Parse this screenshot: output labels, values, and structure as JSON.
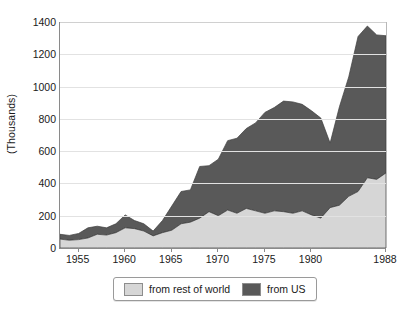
{
  "chart_data": {
    "type": "area",
    "stacked": true,
    "title": "",
    "subtitle": "",
    "xlabel": "",
    "ylabel": "(Thousands)",
    "xlim": [
      1953,
      1988
    ],
    "ylim": [
      0,
      1400
    ],
    "ytick_values": [
      0,
      200,
      400,
      600,
      800,
      1000,
      1200,
      1400
    ],
    "ytick_labels": [
      "0",
      "200",
      "400",
      "600",
      "800",
      "1000",
      "1200",
      "1400"
    ],
    "xtick_values": [
      1955,
      1960,
      1965,
      1970,
      1975,
      1980,
      1988
    ],
    "xtick_labels": [
      "1955",
      "1960",
      "1965",
      "1970",
      "1975",
      "1980",
      "1988"
    ],
    "grid": true,
    "grid_axis": "y",
    "legend_position": "bottom",
    "x": [
      1953,
      1954,
      1955,
      1956,
      1957,
      1958,
      1959,
      1960,
      1961,
      1962,
      1963,
      1964,
      1965,
      1966,
      1967,
      1968,
      1969,
      1970,
      1971,
      1972,
      1973,
      1974,
      1975,
      1976,
      1977,
      1978,
      1979,
      1980,
      1981,
      1982,
      1983,
      1984,
      1985,
      1986,
      1987,
      1988
    ],
    "series": [
      {
        "name": "from rest of world",
        "color": "#d6d6d6",
        "values": [
          55,
          48,
          52,
          62,
          85,
          80,
          95,
          125,
          120,
          105,
          75,
          95,
          110,
          150,
          160,
          185,
          225,
          200,
          235,
          215,
          245,
          230,
          215,
          230,
          225,
          215,
          230,
          205,
          185,
          250,
          265,
          320,
          350,
          435,
          425,
          465
        ]
      },
      {
        "name": "from US",
        "color": "#595959",
        "values": [
          30,
          30,
          38,
          63,
          50,
          45,
          55,
          80,
          50,
          45,
          30,
          75,
          150,
          200,
          200,
          320,
          285,
          350,
          430,
          465,
          495,
          545,
          625,
          640,
          685,
          690,
          660,
          645,
          620,
          400,
          610,
          740,
          960,
          940,
          895,
          850
        ]
      }
    ],
    "totals": [
      85,
      78,
      90,
      125,
      135,
      125,
      150,
      205,
      170,
      150,
      105,
      170,
      260,
      350,
      360,
      505,
      510,
      550,
      665,
      680,
      740,
      775,
      840,
      870,
      910,
      905,
      890,
      850,
      805,
      650,
      875,
      1060,
      1310,
      1375,
      1320,
      1315
    ]
  },
  "legend": {
    "items": [
      {
        "label": "from rest of world",
        "color": "#d6d6d6"
      },
      {
        "label": "from US",
        "color": "#595959"
      }
    ]
  }
}
